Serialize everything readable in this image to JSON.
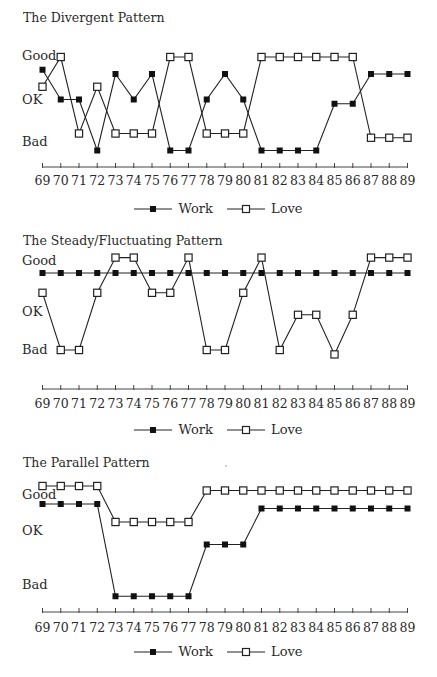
{
  "chart_data": [
    {
      "type": "line",
      "title": "The Divergent Pattern",
      "xlabel": "",
      "ylabel": "",
      "x": [
        "69",
        "70",
        "71",
        "72",
        "73",
        "74",
        "75",
        "76",
        "77",
        "78",
        "79",
        "80",
        "81",
        "82",
        "83",
        "84",
        "85",
        "86",
        "87",
        "88",
        "89"
      ],
      "y_levels": [
        "Good",
        "OK",
        "Bad"
      ],
      "y_scale_note": "3 = Good, 2 = OK, 1 = Bad (values estimated from marker positions)",
      "ylim": [
        0.5,
        3.3
      ],
      "grid": false,
      "legend_position": "bottom-center",
      "series": [
        {
          "name": "Work",
          "marker": "filled-square",
          "values": [
            2.7,
            2.0,
            2.0,
            0.8,
            2.6,
            2.0,
            2.6,
            0.8,
            0.8,
            2.0,
            2.6,
            2.0,
            0.8,
            0.8,
            0.8,
            0.8,
            1.9,
            1.9,
            2.6,
            2.6,
            2.6
          ]
        },
        {
          "name": "Love",
          "marker": "open-square",
          "values": [
            2.3,
            3.0,
            1.2,
            2.3,
            1.2,
            1.2,
            1.2,
            3.0,
            3.0,
            1.2,
            1.2,
            1.2,
            3.0,
            3.0,
            3.0,
            3.0,
            3.0,
            3.0,
            1.1,
            1.1,
            1.1
          ]
        }
      ]
    },
    {
      "type": "line",
      "title": "The Steady/Fluctuating Pattern",
      "xlabel": "",
      "ylabel": "",
      "x": [
        "69",
        "70",
        "71",
        "72",
        "73",
        "74",
        "75",
        "76",
        "77",
        "78",
        "79",
        "80",
        "81",
        "82",
        "83",
        "84",
        "85",
        "86",
        "87",
        "88",
        "89"
      ],
      "y_levels": [
        "Good",
        "OK",
        "Bad"
      ],
      "y_scale_note": "3 = Good, 2 = OK, 1 = Bad (values estimated from marker positions)",
      "ylim": [
        0.5,
        3.3
      ],
      "grid": false,
      "legend_position": "bottom-center",
      "series": [
        {
          "name": "Work",
          "marker": "filled-square",
          "values": [
            2.75,
            2.75,
            2.75,
            2.75,
            2.75,
            2.75,
            2.75,
            2.75,
            2.75,
            2.75,
            2.75,
            2.75,
            2.75,
            2.75,
            2.75,
            2.75,
            2.75,
            2.75,
            2.75,
            2.75,
            2.75
          ]
        },
        {
          "name": "Love",
          "marker": "open-square",
          "values": [
            2.3,
            1.0,
            1.0,
            2.3,
            3.1,
            3.1,
            2.3,
            2.3,
            3.1,
            1.0,
            1.0,
            2.3,
            3.1,
            1.0,
            1.8,
            1.8,
            0.9,
            1.8,
            3.1,
            3.1,
            3.1
          ]
        }
      ]
    },
    {
      "type": "line",
      "title": "The Parallel Pattern",
      "xlabel": "",
      "ylabel": "",
      "x": [
        "69",
        "70",
        "71",
        "72",
        "73",
        "74",
        "75",
        "76",
        "77",
        "78",
        "79",
        "80",
        "81",
        "82",
        "83",
        "84",
        "85",
        "86",
        "87",
        "88",
        "89"
      ],
      "y_levels": [
        "Good",
        "OK",
        "Bad"
      ],
      "y_scale_note": "3 = Good, 2 = OK, 1 = Bad (values estimated from marker positions)",
      "ylim": [
        0.5,
        3.3
      ],
      "grid": false,
      "legend_position": "bottom-center",
      "series": [
        {
          "name": "Work",
          "marker": "filled-square",
          "values": [
            2.8,
            2.8,
            2.8,
            2.8,
            0.75,
            0.75,
            0.75,
            0.75,
            0.75,
            1.9,
            1.9,
            1.9,
            2.7,
            2.7,
            2.7,
            2.7,
            2.7,
            2.7,
            2.7,
            2.7,
            2.7
          ]
        },
        {
          "name": "Love",
          "marker": "open-square",
          "values": [
            3.2,
            3.2,
            3.2,
            3.2,
            2.4,
            2.4,
            2.4,
            2.4,
            2.4,
            3.1,
            3.1,
            3.1,
            3.1,
            3.1,
            3.1,
            3.1,
            3.1,
            3.1,
            3.1,
            3.1,
            3.1
          ]
        }
      ]
    }
  ],
  "panels": [
    {
      "title": "The Divergent Pattern",
      "y_labels": {
        "good": "Good",
        "ok": "OK",
        "bad": "Bad"
      },
      "legend": {
        "work": "Work",
        "love": "Love"
      }
    },
    {
      "title": "The Steady/Fluctuating Pattern",
      "y_labels": {
        "good": "Good",
        "ok": "OK",
        "bad": "Bad"
      },
      "legend": {
        "work": "Work",
        "love": "Love"
      }
    },
    {
      "title": "The Parallel Pattern",
      "y_labels": {
        "good": "Good",
        "ok": "OK",
        "bad": "Bad"
      },
      "legend": {
        "work": "Work",
        "love": "Love"
      }
    }
  ],
  "style": {
    "line_color": "#222222",
    "marker_fill_work": "#111111",
    "marker_fill_love": "#ffffff"
  }
}
